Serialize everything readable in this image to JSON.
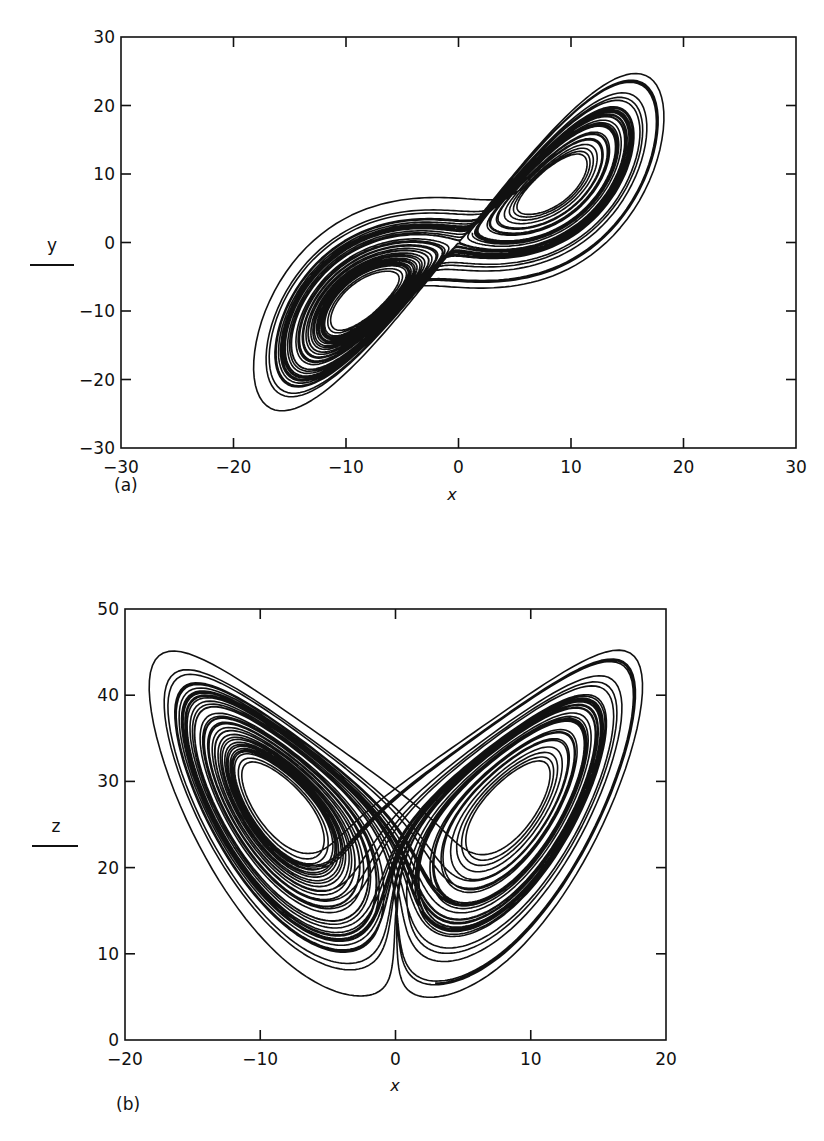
{
  "figure": {
    "panels": [
      {
        "id": "a",
        "panel_label": "(a)",
        "xlabel": "x",
        "ylabel": "y",
        "x_ticks": [
          -30,
          -20,
          -10,
          0,
          10,
          20,
          30
        ],
        "y_ticks": [
          30,
          20,
          10,
          0,
          -10,
          -20,
          -30
        ],
        "x_tick_labels": [
          "−30",
          "−20",
          "−10",
          "0",
          "10",
          "20",
          "30"
        ],
        "y_tick_labels": [
          "30",
          "20",
          "10",
          "0",
          "−10",
          "−20",
          "−30"
        ]
      },
      {
        "id": "b",
        "panel_label": "(b)",
        "xlabel": "x",
        "ylabel": "z",
        "x_ticks": [
          -20,
          -10,
          0,
          10,
          20
        ],
        "y_ticks": [
          50,
          40,
          30,
          20,
          10,
          0
        ],
        "x_tick_labels": [
          "−20",
          "−10",
          "0",
          "10",
          "20"
        ],
        "y_tick_labels": [
          "50",
          "40",
          "30",
          "20",
          "10",
          "0"
        ]
      }
    ],
    "line_color": "#111111"
  },
  "chart_data": [
    {
      "type": "line",
      "title": "",
      "subtitle": "Lorenz attractor projected onto the x–y plane",
      "xlabel": "x",
      "ylabel": "y",
      "xlim": [
        -30,
        30
      ],
      "ylim": [
        -30,
        30
      ],
      "grid": false,
      "legend": null,
      "annotations": [
        "(a)"
      ],
      "series": [
        {
          "name": "trajectory (x, y)",
          "description": "Two spiral lobes centered near (-8.5, -8.5) and (8.5, 8.5); extent x ≈ -18..18, y ≈ -25..24",
          "generator": {
            "system": "lorenz",
            "sigma": 10,
            "rho": 28,
            "beta": 2.6667,
            "x0": 1,
            "y0": 1,
            "z0": 20,
            "dt": 0.005,
            "steps": 12000,
            "skip": 400
          }
        }
      ]
    },
    {
      "type": "line",
      "title": "",
      "subtitle": "Lorenz attractor projected onto the x–z plane (butterfly)",
      "xlabel": "x",
      "ylabel": "z",
      "xlim": [
        -20,
        20
      ],
      "ylim": [
        0,
        50
      ],
      "grid": false,
      "legend": null,
      "annotations": [
        "(b)"
      ],
      "series": [
        {
          "name": "trajectory (x, z)",
          "description": "Two wings with holes near (-8.5, 27) and (8.5, 27); extent x ≈ -19..18, z ≈ 4..46",
          "generator": {
            "system": "lorenz",
            "sigma": 10,
            "rho": 28,
            "beta": 2.6667,
            "x0": 1,
            "y0": 1,
            "z0": 20,
            "dt": 0.005,
            "steps": 12000,
            "skip": 400
          }
        }
      ]
    }
  ]
}
